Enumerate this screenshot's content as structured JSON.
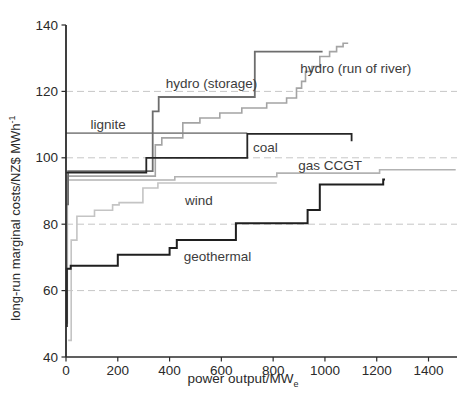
{
  "figure": {
    "width": 466,
    "height": 402,
    "background": "#ffffff"
  },
  "chart_data": {
    "type": "line",
    "subtype": "step-supply-curves",
    "title": "",
    "xlabel": {
      "text": "power output/MW",
      "sub": "e"
    },
    "ylabel": {
      "text": "long-run marginal costs/NZ$ MWh",
      "sup": "-1"
    },
    "x_axis": {
      "min": 0,
      "max": 1510,
      "ticks": [
        0,
        200,
        400,
        600,
        800,
        1000,
        1200,
        1400
      ]
    },
    "y_axis": {
      "min": 40,
      "max": 140,
      "ticks": [
        40,
        60,
        80,
        100,
        120,
        140
      ]
    },
    "gridlines_y": [
      60,
      80,
      100,
      120
    ],
    "grid_on": true,
    "legend_position": "inline-labels",
    "colors": {
      "grid": "#c6c6c6",
      "axis": "#2b2b2b",
      "tick_text": "#2a2a2a",
      "series_label_text": "#3c3c3c"
    },
    "plot_area": {
      "left": 66,
      "top": 25,
      "right": 457,
      "bottom": 357
    },
    "series": [
      {
        "name": "wind",
        "color": "#c4c4c4",
        "width": 1.6,
        "label": {
          "text": "wind",
          "x": 460,
          "y": 85.8
        },
        "points": [
          [
            8,
            45
          ],
          [
            20,
            45
          ],
          [
            20,
            75.2
          ],
          [
            42,
            75.2
          ],
          [
            42,
            82.4
          ],
          [
            110,
            82.4
          ],
          [
            110,
            84.2
          ],
          [
            180,
            84.2
          ],
          [
            180,
            85.8
          ],
          [
            205,
            85.8
          ],
          [
            205,
            86.5
          ],
          [
            297,
            86.5
          ],
          [
            297,
            90.9
          ],
          [
            355,
            90.9
          ],
          [
            355,
            92.4
          ],
          [
            814,
            92.4
          ]
        ]
      },
      {
        "name": "gas CCGT",
        "color": "#b2b2b2",
        "width": 1.6,
        "label": {
          "text": "gas CCGT",
          "x": 897,
          "y": 96.3
        },
        "points": [
          [
            0,
            93.3
          ],
          [
            420,
            93.3
          ],
          [
            420,
            94.3
          ],
          [
            814,
            94.3
          ],
          [
            814,
            95.4
          ],
          [
            1211,
            95.4
          ],
          [
            1211,
            96.4
          ],
          [
            1505,
            96.4
          ]
        ]
      },
      {
        "name": "hydro (run of river)",
        "color": "#a4a4a4",
        "width": 1.6,
        "label": {
          "text": "hydro (run of river)",
          "x": 905,
          "y": 125.4
        },
        "points": [
          [
            5,
            50
          ],
          [
            5,
            94.5
          ],
          [
            345,
            94.5
          ],
          [
            345,
            103.9
          ],
          [
            370,
            103.9
          ],
          [
            370,
            106
          ],
          [
            451,
            106
          ],
          [
            451,
            110.5
          ],
          [
            517,
            110.5
          ],
          [
            517,
            112
          ],
          [
            594,
            112
          ],
          [
            594,
            113.5
          ],
          [
            679,
            113.5
          ],
          [
            679,
            115
          ],
          [
            775,
            115
          ],
          [
            775,
            116.5
          ],
          [
            852,
            116.5
          ],
          [
            852,
            118
          ],
          [
            890,
            118
          ],
          [
            890,
            121
          ],
          [
            910,
            121
          ],
          [
            910,
            123
          ],
          [
            925,
            123
          ],
          [
            925,
            126
          ],
          [
            950,
            126
          ],
          [
            950,
            127.5
          ],
          [
            980,
            127.5
          ],
          [
            980,
            130.5
          ],
          [
            1018,
            130.5
          ],
          [
            1018,
            132
          ],
          [
            1045,
            132
          ],
          [
            1045,
            133.5
          ],
          [
            1070,
            133.5
          ],
          [
            1070,
            134.5
          ],
          [
            1090,
            134.5
          ]
        ]
      },
      {
        "name": "lignite",
        "color": "#8b8b8b",
        "width": 1.7,
        "label": {
          "text": "lignite",
          "x": 95,
          "y": 108.7
        },
        "points": [
          [
            0,
            107.4
          ],
          [
            700,
            107.4
          ]
        ]
      },
      {
        "name": "hydro (storage)",
        "color": "#6d6d6d",
        "width": 1.8,
        "label": {
          "text": "hydro (storage)",
          "x": 385,
          "y": 120.9
        },
        "points": [
          [
            2,
            86
          ],
          [
            8,
            86
          ],
          [
            8,
            96
          ],
          [
            335,
            96
          ],
          [
            335,
            114
          ],
          [
            358,
            114
          ],
          [
            358,
            118.3
          ],
          [
            729,
            118.3
          ],
          [
            729,
            132
          ],
          [
            991,
            132
          ]
        ]
      },
      {
        "name": "coal",
        "color": "#262626",
        "width": 1.8,
        "label": {
          "text": "coal",
          "x": 722,
          "y": 101.6
        },
        "points": [
          [
            0,
            95.5
          ],
          [
            310,
            95.5
          ],
          [
            310,
            100
          ],
          [
            700,
            100
          ],
          [
            700,
            107.2
          ],
          [
            1103,
            107.2
          ],
          [
            1103,
            105
          ]
        ]
      },
      {
        "name": "geothermal",
        "color": "#1f1f1f",
        "width": 2,
        "label": {
          "text": "geothermal",
          "x": 455,
          "y": 68.9
        },
        "points": [
          [
            3,
            49
          ],
          [
            3,
            66.6
          ],
          [
            18,
            66.6
          ],
          [
            18,
            67.5
          ],
          [
            200,
            67.5
          ],
          [
            200,
            70.8
          ],
          [
            400,
            70.8
          ],
          [
            400,
            72.8
          ],
          [
            428,
            72.8
          ],
          [
            428,
            75.2
          ],
          [
            656,
            75.2
          ],
          [
            656,
            80.3
          ],
          [
            933,
            80.3
          ],
          [
            933,
            84.3
          ],
          [
            980,
            84.3
          ],
          [
            980,
            92
          ],
          [
            1225,
            92
          ],
          [
            1225,
            93.5
          ],
          [
            1232,
            93.5
          ]
        ]
      }
    ]
  }
}
